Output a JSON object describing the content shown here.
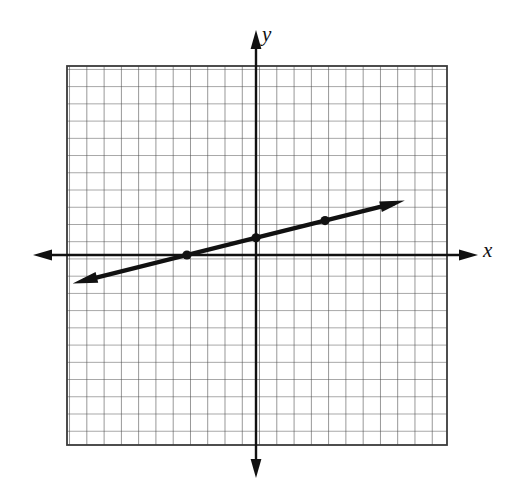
{
  "figure": {
    "axis_labels": {
      "x": "x",
      "y": "y"
    },
    "colors": {
      "grid": "#3a3a3a",
      "axis": "#111111",
      "line": "#111111",
      "background": "#ffffff"
    }
  },
  "chart_data": {
    "type": "line",
    "title": "",
    "xlabel": "x",
    "ylabel": "y",
    "grid": true,
    "legend_position": "none",
    "xlim": [
      -11,
      11
    ],
    "ylim": [
      -11,
      11
    ],
    "x_tick_step": 1,
    "y_tick_step": 1,
    "tick_labels_shown": false,
    "origin": {
      "x": 0,
      "y": 0
    },
    "series": [
      {
        "name": "line",
        "equation": "y = (1/4)x + 1",
        "slope": 0.25,
        "intercept": 1,
        "x": [
          -10,
          8
        ],
        "values": [
          -1.5,
          3
        ],
        "arrow_start": true,
        "arrow_end": true,
        "marked_points": [
          {
            "x": -4,
            "y": 0
          },
          {
            "x": 0,
            "y": 1
          },
          {
            "x": 4,
            "y": 2
          }
        ]
      }
    ]
  }
}
